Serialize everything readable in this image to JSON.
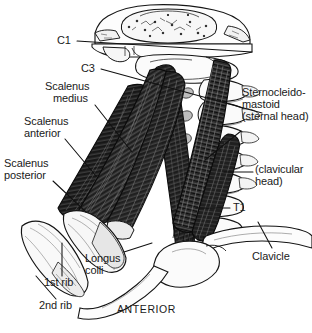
{
  "figure": {
    "orientation_label": "ANTERIOR",
    "ink_color": "#1a1a1a",
    "muscle_fill": "#2b2b2b",
    "bone_fill": "#f2f2f2",
    "bone_shade": "#cfcfcf",
    "outline_color": "#111111"
  },
  "labels": {
    "c1": "C1",
    "c3": "C3",
    "scalenus_medius_line1": "Scalenus",
    "scalenus_medius_line2": "medius",
    "scalenus_anterior_line1": "Scalenus",
    "scalenus_anterior_line2": "anterior",
    "scalenus_posterior_line1": "Scalenus",
    "scalenus_posterior_line2": "posterior",
    "first_rib": "1st rib",
    "second_rib": "2nd rib",
    "longus_colli_line1": "Longus",
    "longus_colli_line2": "colli",
    "scm_line1": "Sternocleido-",
    "scm_line2": "mastoid",
    "scm_line3": "(sternal head)",
    "clavicular_head_line1": "(clavicular",
    "clavicular_head_line2": "head)",
    "t1": "T1",
    "clavicle": "Clavicle",
    "anterior": "ANTERIOR"
  },
  "structures": [
    {
      "name": "skull-base",
      "kind": "bone"
    },
    {
      "name": "mandible",
      "kind": "bone"
    },
    {
      "name": "cervical-vertebrae",
      "kind": "bone"
    },
    {
      "name": "first-rib",
      "kind": "bone"
    },
    {
      "name": "second-rib",
      "kind": "bone"
    },
    {
      "name": "clavicle",
      "kind": "bone"
    },
    {
      "name": "manubrium",
      "kind": "bone"
    },
    {
      "name": "scalenus-posterior",
      "kind": "muscle"
    },
    {
      "name": "scalenus-medius",
      "kind": "muscle"
    },
    {
      "name": "scalenus-anterior",
      "kind": "muscle"
    },
    {
      "name": "longus-colli",
      "kind": "muscle"
    },
    {
      "name": "sternocleidomastoid-sternal-head",
      "kind": "muscle"
    },
    {
      "name": "sternocleidomastoid-clavicular-head",
      "kind": "muscle"
    }
  ]
}
